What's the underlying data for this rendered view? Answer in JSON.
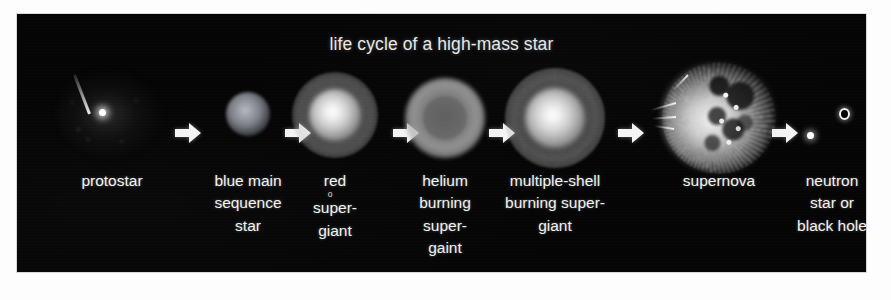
{
  "title": "life cycle of a high-mass star",
  "theme": {
    "panel_background": "#050505",
    "page_background": "#fdfdfd",
    "text_color": "#f2f2f2",
    "arrow_color": "#f4f4f4"
  },
  "stages": [
    {
      "id": "protostar",
      "icon": "protostar-icon",
      "lines": [
        "protostar"
      ]
    },
    {
      "id": "blue-main-sequence-star",
      "icon": "blue-main-sequence-star-icon",
      "lines": [
        "blue main",
        "sequence",
        "star"
      ]
    },
    {
      "id": "red-supergiant",
      "icon": "red-supergiant-icon",
      "lines": [
        "red",
        "super-",
        "giant"
      ],
      "speck": "o"
    },
    {
      "id": "helium-burning-supergaint",
      "icon": "helium-burning-supergiant-icon",
      "lines": [
        "helium",
        "burning",
        "super-",
        "gaint"
      ]
    },
    {
      "id": "multiple-shell-burning-supergiant",
      "icon": "multiple-shell-burning-supergiant-icon",
      "lines": [
        "multiple-shell",
        "burning super-",
        "giant"
      ]
    },
    {
      "id": "supernova",
      "icon": "supernova-icon",
      "lines": [
        "supernova"
      ]
    },
    {
      "id": "neutron-star-or-black-hole",
      "icon": "neutron-star-black-hole-icon",
      "lines": [
        "neutron",
        "star or",
        "black hole"
      ]
    }
  ],
  "arrows": [
    {
      "id": "arrow-protostar-to-blue-main-sequence"
    },
    {
      "id": "arrow-blue-main-sequence-to-red-supergiant"
    },
    {
      "id": "arrow-red-supergiant-to-helium-burning"
    },
    {
      "id": "arrow-helium-burning-to-multiple-shell"
    },
    {
      "id": "arrow-multiple-shell-to-supernova"
    },
    {
      "id": "arrow-supernova-to-remnant"
    }
  ]
}
